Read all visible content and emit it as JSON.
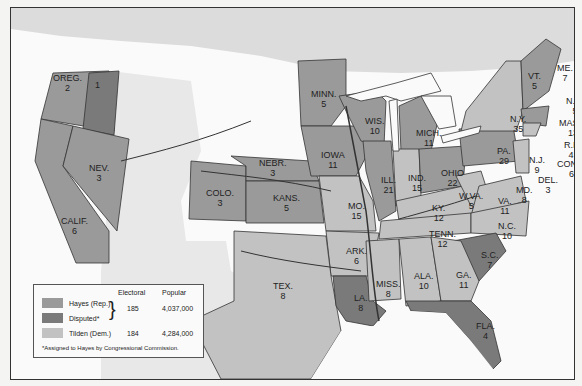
{
  "map": {
    "colors": {
      "hayes": "#9a9a9a",
      "disputed": "#7a7a7a",
      "tilden": "#c2c2c2",
      "territory": "#d8d8d8",
      "water": "#fafafa",
      "canada": "#dcdcdc"
    },
    "states": [
      {
        "abbr": "OREG.",
        "votes": "2",
        "party": "hayes"
      },
      {
        "abbr": "",
        "votes": "1",
        "party": "disputed"
      },
      {
        "abbr": "CALIF.",
        "votes": "6",
        "party": "hayes"
      },
      {
        "abbr": "NEV.",
        "votes": "3",
        "party": "hayes"
      },
      {
        "abbr": "COLO.",
        "votes": "3",
        "party": "hayes"
      },
      {
        "abbr": "NEBR.",
        "votes": "3",
        "party": "hayes"
      },
      {
        "abbr": "KANS.",
        "votes": "5",
        "party": "hayes"
      },
      {
        "abbr": "MINN.",
        "votes": "5",
        "party": "hayes"
      },
      {
        "abbr": "IOWA",
        "votes": "11",
        "party": "hayes"
      },
      {
        "abbr": "MO.",
        "votes": "15",
        "party": "tilden"
      },
      {
        "abbr": "TEX.",
        "votes": "8",
        "party": "tilden"
      },
      {
        "abbr": "ARK.",
        "votes": "6",
        "party": "tilden"
      },
      {
        "abbr": "LA.",
        "votes": "8",
        "party": "disputed"
      },
      {
        "abbr": "WIS.",
        "votes": "10",
        "party": "hayes"
      },
      {
        "abbr": "ILL.",
        "votes": "21",
        "party": "hayes"
      },
      {
        "abbr": "MICH.",
        "votes": "11",
        "party": "hayes"
      },
      {
        "abbr": "IND.",
        "votes": "15",
        "party": "tilden"
      },
      {
        "abbr": "OHIO",
        "votes": "22",
        "party": "hayes"
      },
      {
        "abbr": "KY.",
        "votes": "12",
        "party": "tilden"
      },
      {
        "abbr": "TENN.",
        "votes": "12",
        "party": "tilden"
      },
      {
        "abbr": "MISS.",
        "votes": "8",
        "party": "tilden"
      },
      {
        "abbr": "ALA.",
        "votes": "10",
        "party": "tilden"
      },
      {
        "abbr": "GA.",
        "votes": "11",
        "party": "tilden"
      },
      {
        "abbr": "FLA.",
        "votes": "4",
        "party": "disputed"
      },
      {
        "abbr": "S.C.",
        "votes": "7",
        "party": "disputed"
      },
      {
        "abbr": "N.C.",
        "votes": "10",
        "party": "tilden"
      },
      {
        "abbr": "VA.",
        "votes": "11",
        "party": "tilden"
      },
      {
        "abbr": "W.VA.",
        "votes": "5",
        "party": "tilden"
      },
      {
        "abbr": "PA.",
        "votes": "29",
        "party": "hayes"
      },
      {
        "abbr": "N.Y.",
        "votes": "35",
        "party": "tilden"
      },
      {
        "abbr": "N.J.",
        "votes": "9",
        "party": "tilden"
      },
      {
        "abbr": "DEL.",
        "votes": "3",
        "party": "tilden"
      },
      {
        "abbr": "MD.",
        "votes": "8",
        "party": "tilden"
      },
      {
        "abbr": "VT.",
        "votes": "5",
        "party": "hayes"
      },
      {
        "abbr": "ME.",
        "votes": "7",
        "party": "hayes"
      },
      {
        "abbr": "N.H.",
        "votes": "5",
        "party": "hayes"
      },
      {
        "abbr": "MASS.",
        "votes": "13",
        "party": "hayes"
      },
      {
        "abbr": "R.I.",
        "votes": "4",
        "party": "hayes"
      },
      {
        "abbr": "CONN.",
        "votes": "6",
        "party": "tilden"
      }
    ]
  },
  "legend": {
    "col_electoral": "Electoral",
    "col_popular": "Popular",
    "items": [
      {
        "label": "Hayes (Rep.)"
      },
      {
        "label": "Disputed*"
      },
      {
        "label": "Tilden (Dem.)"
      }
    ],
    "hayes_electoral": "185",
    "hayes_popular": "4,037,000",
    "tilden_electoral": "184",
    "tilden_popular": "4,284,000",
    "footnote": "*Assigned to Hayes by Congressional Commission."
  }
}
